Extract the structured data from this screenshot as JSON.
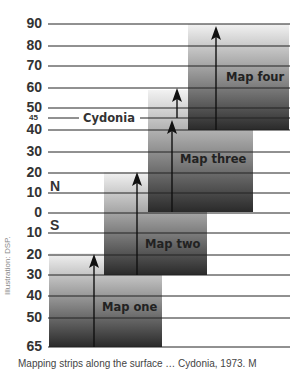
{
  "diagram": {
    "axis": {
      "ticks": [
        {
          "label": "90",
          "y": 24
        },
        {
          "label": "80",
          "y": 46
        },
        {
          "label": "70",
          "y": 66
        },
        {
          "label": "60",
          "y": 88
        },
        {
          "label": "50",
          "y": 108
        },
        {
          "label": "45",
          "y": 118,
          "small": true
        },
        {
          "label": "40",
          "y": 130
        },
        {
          "label": "30",
          "y": 152
        },
        {
          "label": "20",
          "y": 173
        },
        {
          "label": "10",
          "y": 193
        },
        {
          "label": "0",
          "y": 213
        },
        {
          "label": "10",
          "y": 233
        },
        {
          "label": "20",
          "y": 255
        },
        {
          "label": "30",
          "y": 275
        },
        {
          "label": "40",
          "y": 296
        },
        {
          "label": "50",
          "y": 318
        },
        {
          "label": "65",
          "y": 347
        }
      ],
      "north_label": "N",
      "south_label": "S"
    },
    "landmark": {
      "label": "Cydonia",
      "latitude": "45"
    },
    "maps": [
      {
        "label": "Map one",
        "x": 49,
        "y": 253,
        "w": 113,
        "h": 94
      },
      {
        "label": "Map two",
        "x": 104,
        "y": 172,
        "w": 103,
        "h": 103
      },
      {
        "label": "Map three",
        "x": 148,
        "y": 90,
        "w": 105,
        "h": 122
      },
      {
        "label": "Map four",
        "x": 188,
        "y": 24,
        "w": 101,
        "h": 106
      }
    ],
    "credit": "Illustration: DSP.",
    "caption": "Mapping strips along the surface … Cydonia, 1973. M"
  }
}
